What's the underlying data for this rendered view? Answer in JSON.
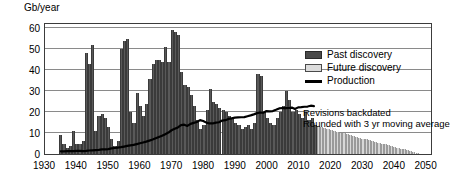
{
  "chart_data": {
    "type": "bar",
    "title": "",
    "subtitle": "",
    "xlabel": "",
    "ylabel": "Gb/year",
    "unit_label": "Gb/year",
    "xlim": [
      1930,
      2052
    ],
    "ylim": [
      0,
      63
    ],
    "yticks": [
      0,
      10,
      20,
      30,
      40,
      50,
      60
    ],
    "ytick_labels": [
      "0",
      "10",
      "20",
      "30",
      "40",
      "50",
      "60"
    ],
    "xticks": [
      1930,
      1940,
      1950,
      1960,
      1970,
      1980,
      1990,
      2000,
      2010,
      2020,
      2030,
      2040,
      2050
    ],
    "xtick_labels": [
      "1930",
      "1940",
      "1950",
      "1960",
      "1970",
      "1980",
      "1990",
      "2000",
      "2010",
      "2020",
      "2030",
      "2040",
      "2050"
    ],
    "grid": true,
    "grid_axis": "y",
    "legend_position": "upper-right-inside",
    "legend": [
      {
        "label": "Past discovery",
        "marker": "filled-rect",
        "color": "#4a4a4a"
      },
      {
        "label": "Future discovery",
        "marker": "outlined-rect",
        "color": "#dcdcdc"
      },
      {
        "label": "Production",
        "marker": "line",
        "color": "#000000"
      }
    ],
    "annotations": [
      "Revisions backdated",
      "Rounded with 3 yr moving average"
    ],
    "series": [
      {
        "name": "Past discovery",
        "type": "bar",
        "color": "#595959",
        "x": [
          1935,
          1936,
          1937,
          1938,
          1939,
          1940,
          1941,
          1942,
          1943,
          1944,
          1945,
          1946,
          1947,
          1948,
          1949,
          1950,
          1951,
          1952,
          1953,
          1954,
          1955,
          1956,
          1957,
          1958,
          1959,
          1960,
          1961,
          1962,
          1963,
          1964,
          1965,
          1966,
          1967,
          1968,
          1969,
          1970,
          1971,
          1972,
          1973,
          1974,
          1975,
          1976,
          1977,
          1978,
          1979,
          1980,
          1981,
          1982,
          1983,
          1984,
          1985,
          1986,
          1987,
          1988,
          1989,
          1990,
          1991,
          1992,
          1993,
          1994,
          1995,
          1996,
          1997,
          1998,
          1999,
          2000,
          2001,
          2002,
          2003,
          2004,
          2005,
          2006,
          2007,
          2008,
          2009,
          2010,
          2011,
          2012,
          2013,
          2014,
          2015
        ],
        "values": [
          9,
          5,
          3,
          4,
          11,
          5,
          5,
          6,
          48,
          43,
          52,
          11,
          18,
          19,
          17,
          13,
          7,
          4,
          6,
          50,
          54,
          55,
          20,
          15,
          29,
          23,
          18,
          24,
          36,
          43,
          45,
          45,
          44,
          51,
          44,
          59,
          58,
          57,
          39,
          33,
          32,
          28,
          23,
          16,
          12,
          14,
          21,
          31,
          25,
          24,
          22,
          21,
          20,
          18,
          17,
          15,
          14,
          12,
          13,
          14,
          12,
          15,
          38,
          37,
          20,
          17,
          15,
          14,
          17,
          20,
          23,
          30,
          26,
          20,
          21,
          19,
          17,
          20,
          16,
          17,
          14
        ]
      },
      {
        "name": "Future discovery",
        "type": "bar",
        "color": "#d8d8d8",
        "x": [
          2016,
          2017,
          2018,
          2019,
          2020,
          2021,
          2022,
          2023,
          2024,
          2025,
          2026,
          2027,
          2028,
          2029,
          2030,
          2031,
          2032,
          2033,
          2034,
          2035,
          2036,
          2037,
          2038,
          2039,
          2040,
          2041,
          2042,
          2043,
          2044,
          2045,
          2046,
          2047
        ],
        "values": [
          13.5,
          13,
          12.5,
          12,
          11.5,
          11,
          10.6,
          10.2,
          9.8,
          9.4,
          9,
          8.6,
          8.2,
          7.8,
          7.4,
          7,
          6.6,
          6.2,
          5.8,
          5.4,
          5,
          4.6,
          4.2,
          3.8,
          3.4,
          3,
          2.6,
          2.2,
          1.8,
          1.4,
          1,
          0.6
        ]
      },
      {
        "name": "Production",
        "type": "line",
        "color": "#000000",
        "x": [
          1935,
          1936,
          1937,
          1938,
          1939,
          1940,
          1941,
          1942,
          1943,
          1944,
          1945,
          1946,
          1947,
          1948,
          1949,
          1950,
          1951,
          1952,
          1953,
          1954,
          1955,
          1956,
          1957,
          1958,
          1959,
          1960,
          1961,
          1962,
          1963,
          1964,
          1965,
          1966,
          1967,
          1968,
          1969,
          1970,
          1971,
          1972,
          1973,
          1974,
          1975,
          1976,
          1977,
          1978,
          1979,
          1980,
          1981,
          1982,
          1983,
          1984,
          1985,
          1986,
          1987,
          1988,
          1989,
          1990,
          1991,
          1992,
          1993,
          1994,
          1995,
          1996,
          1997,
          1998,
          1999,
          2000,
          2001,
          2002,
          2003,
          2004,
          2005,
          2006,
          2007,
          2008,
          2009,
          2010,
          2011,
          2012,
          2013,
          2014,
          2015
        ],
        "values": [
          1.3,
          1.3,
          1.4,
          1.4,
          1.4,
          1.5,
          1.5,
          1.4,
          1.5,
          1.7,
          1.8,
          1.9,
          2.0,
          2.2,
          2.2,
          2.4,
          2.7,
          2.9,
          3.1,
          3.3,
          3.6,
          3.9,
          4.2,
          4.4,
          4.8,
          5.2,
          5.6,
          6.0,
          6.5,
          7.0,
          7.6,
          8.2,
          8.8,
          9.6,
          10.4,
          11.5,
          12.2,
          12.9,
          14.0,
          14.2,
          13.6,
          14.6,
          15.1,
          15.5,
          16.4,
          16.0,
          15.2,
          14.8,
          14.8,
          15.2,
          15.4,
          16.2,
          16.4,
          17.0,
          17.3,
          17.6,
          17.7,
          17.8,
          17.9,
          18.3,
          18.7,
          19.2,
          19.8,
          20.1,
          20.0,
          20.8,
          20.7,
          20.8,
          21.4,
          22.1,
          22.3,
          22.2,
          22.3,
          22.5,
          21.8,
          22.6,
          22.7,
          22.9,
          23.0,
          23.4,
          23.2
        ]
      }
    ]
  }
}
